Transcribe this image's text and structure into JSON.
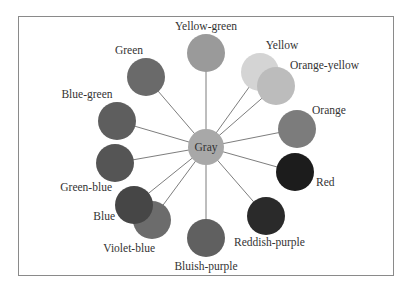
{
  "diagram": {
    "center": {
      "label": "Gray",
      "x": 206,
      "y": 147,
      "r": 18,
      "color": "#a8a8a8"
    },
    "spoke_color": "#6e6e6e",
    "nodes": [
      {
        "label": "Yellow-green",
        "x": 206,
        "y": 53,
        "r": 19,
        "color": "#9a9a9a",
        "lx": 206,
        "ly": 30,
        "anchor": "middle"
      },
      {
        "label": "Yellow",
        "x": 260,
        "y": 72,
        "r": 19,
        "color": "#d4d4d4",
        "lx": 282,
        "ly": 49,
        "anchor": "middle"
      },
      {
        "label": "Orange-yellow",
        "x": 276,
        "y": 86,
        "r": 19,
        "color": "#bcbcbc",
        "lx": 290,
        "ly": 69,
        "anchor": "start"
      },
      {
        "label": "Orange",
        "x": 297,
        "y": 129,
        "r": 19,
        "color": "#7c7c7c",
        "lx": 312,
        "ly": 114,
        "anchor": "start"
      },
      {
        "label": "Red",
        "x": 295,
        "y": 172,
        "r": 19,
        "color": "#1c1c1c",
        "lx": 316,
        "ly": 186,
        "anchor": "start"
      },
      {
        "label": "Reddish-purple",
        "x": 266,
        "y": 216,
        "r": 19,
        "color": "#2a2a2a",
        "lx": 234,
        "ly": 246,
        "anchor": "start"
      },
      {
        "label": "Bluish-purple",
        "x": 206,
        "y": 238,
        "r": 19,
        "color": "#606060",
        "lx": 206,
        "ly": 270,
        "anchor": "middle"
      },
      {
        "label": "Violet-blue",
        "x": 152,
        "y": 220,
        "r": 19,
        "color": "#6c6c6c",
        "lx": 155,
        "ly": 252,
        "anchor": "end"
      },
      {
        "label": "Blue",
        "x": 134,
        "y": 205,
        "r": 19,
        "color": "#464646",
        "lx": 115,
        "ly": 220,
        "anchor": "end"
      },
      {
        "label": "Green-blue",
        "x": 115,
        "y": 163,
        "r": 19,
        "color": "#555555",
        "lx": 112,
        "ly": 191,
        "anchor": "end"
      },
      {
        "label": "Blue-green",
        "x": 117,
        "y": 121,
        "r": 19,
        "color": "#5e5e5e",
        "lx": 87,
        "ly": 98,
        "anchor": "middle"
      },
      {
        "label": "Green",
        "x": 146,
        "y": 77,
        "r": 19,
        "color": "#6a6a6a",
        "lx": 129,
        "ly": 54,
        "anchor": "middle"
      }
    ]
  }
}
